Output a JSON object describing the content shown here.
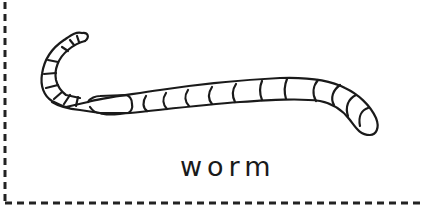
{
  "card": {
    "label": "worm",
    "illustration": "worm-icon",
    "border_style": "dashed",
    "colors": {
      "stroke": "#1a1a1a",
      "background": "#ffffff",
      "border": "#222222"
    }
  }
}
